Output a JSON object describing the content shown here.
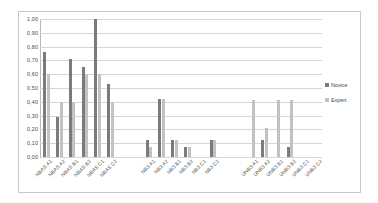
{
  "chart_data": {
    "type": "bar",
    "title": "",
    "xlabel": "",
    "ylabel": "",
    "ylim": [
      0,
      1.0
    ],
    "grid": true,
    "legend_position": "right",
    "ytick_labels": [
      "1,00",
      "0,90",
      "0,80",
      "0,70",
      "0,60",
      "0,50",
      "0,40",
      "0,30",
      "0,20",
      "0,10",
      "0,00"
    ],
    "ytick_values": [
      1.0,
      0.9,
      0.8,
      0.7,
      0.6,
      0.5,
      0.4,
      0.3,
      0.2,
      0.1,
      0.0
    ],
    "categories": [
      "NBAS A1",
      "NBAS A2",
      "NBAS B1",
      "NBAS B2",
      "NBAS C1",
      "NBAS C2",
      "",
      "",
      "NB3 A1",
      "NB3 A2",
      "NB3 B1",
      "NB3 B2",
      "NB3 C1",
      "NB3 C2",
      "",
      "",
      "UNB3 A1",
      "UNB3 A2",
      "UNB3 B1",
      "UNB3 B2",
      "UNB3 C1",
      "UNB3 C2"
    ],
    "series": [
      {
        "name": "Novice",
        "color": "#7b7b7b",
        "values": [
          0.76,
          0.29,
          0.71,
          0.65,
          1.0,
          0.53,
          null,
          null,
          0.12,
          0.42,
          0.12,
          0.07,
          0.0,
          0.12,
          null,
          null,
          0.0,
          0.12,
          0.0,
          0.07,
          0.0,
          0.0
        ]
      },
      {
        "name": "Expert",
        "color": "#c2c2c2",
        "values": [
          0.6,
          0.4,
          0.4,
          0.6,
          0.6,
          0.4,
          null,
          null,
          0.07,
          0.42,
          0.12,
          0.07,
          0.0,
          0.12,
          null,
          null,
          0.41,
          0.21,
          0.41,
          0.41,
          0.0,
          0.0
        ]
      }
    ]
  },
  "legend": {
    "entries": [
      {
        "label": "Novice",
        "color": "#7b7b7b"
      },
      {
        "label": "Expert",
        "color": "#c2c2c2"
      }
    ]
  }
}
